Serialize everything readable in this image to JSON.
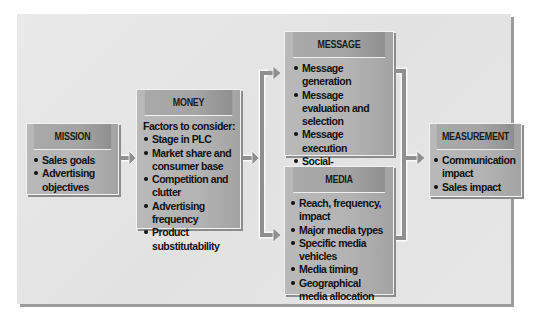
{
  "diagram": {
    "type": "flow",
    "boxes": {
      "mission": {
        "title": "MISSION",
        "items": [
          "Sales goals",
          "Advertising objectives"
        ]
      },
      "money": {
        "title": "MONEY",
        "intro": "Factors to consider:",
        "items": [
          "Stage in PLC",
          "Market share and consumer base",
          "Competition and clutter",
          "Advertising frequency",
          "Product substitutability"
        ]
      },
      "message": {
        "title": "MESSAGE",
        "items": [
          "Message generation",
          "Message evaluation and selection",
          "Message execution",
          "Social-responsibility review"
        ]
      },
      "media": {
        "title": "MEDIA",
        "items": [
          "Reach, frequency, impact",
          "Major media types",
          "Specific media vehicles",
          "Media timing",
          "Geographical media allocation"
        ]
      },
      "measurement": {
        "title": "MEASUREMENT",
        "items": [
          "Communication impact",
          "Sales impact"
        ]
      }
    },
    "edges": [
      {
        "from": "MISSION",
        "to": "MONEY"
      },
      {
        "from": "MONEY",
        "to": "MESSAGE"
      },
      {
        "from": "MONEY",
        "to": "MEDIA"
      },
      {
        "from": "MESSAGE",
        "to": "MEASUREMENT"
      },
      {
        "from": "MEDIA",
        "to": "MEASUREMENT"
      }
    ],
    "colors": {
      "panel": "#e6e6e6",
      "box": "#b5b5b5",
      "header": "#a6a6a6",
      "arrow": "#8f8f8f",
      "text": "#111111"
    }
  }
}
